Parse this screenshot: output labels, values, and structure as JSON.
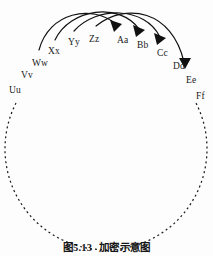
{
  "figure": {
    "caption_number": "图5.13",
    "caption_title": "加密示意图",
    "background_color": "#fdfdfd",
    "ink_color": "#1a1a1a"
  },
  "diagram": {
    "type": "cipher-wheel-mapping",
    "ring": {
      "name": "alphabet-ring",
      "style": "dashed",
      "shape": "circle",
      "center_x": 106,
      "center_y": 195,
      "radius": 101,
      "dash_pattern": "2 3"
    },
    "plaintext_labels": [
      {
        "id": "uu",
        "text": "Uu",
        "x": 9,
        "y": 86
      },
      {
        "id": "vv",
        "text": "Vv",
        "x": 21,
        "y": 71
      },
      {
        "id": "ww",
        "text": "Ww",
        "x": 32,
        "y": 59
      },
      {
        "id": "xx",
        "text": "Xx",
        "x": 48,
        "y": 47
      },
      {
        "id": "yy",
        "text": "Yy",
        "x": 68,
        "y": 38
      },
      {
        "id": "zz",
        "text": "Zz",
        "x": 89,
        "y": 35
      }
    ],
    "ciphertext_labels": [
      {
        "id": "aa",
        "text": "Aa",
        "x": 117,
        "y": 36
      },
      {
        "id": "bb",
        "text": "Bb",
        "x": 137,
        "y": 41
      },
      {
        "id": "cc",
        "text": "Cc",
        "x": 157,
        "y": 49
      },
      {
        "id": "dd",
        "text": "Dd",
        "x": 173,
        "y": 62
      },
      {
        "id": "ee",
        "text": "Ee",
        "x": 186,
        "y": 76
      },
      {
        "id": "ff",
        "text": "Ff",
        "x": 196,
        "y": 92
      }
    ],
    "mapping_arrows": [
      {
        "id": "arrow-ww-to-aa",
        "from": "Ww",
        "to": "Aa"
      },
      {
        "id": "arrow-xx-to-bb",
        "from": "Xx",
        "to": "Bb"
      },
      {
        "id": "arrow-yy-to-cc",
        "from": "Yy",
        "to": "Cc"
      },
      {
        "id": "arrow-zz-to-ee",
        "from": "Zz",
        "to": "Ee"
      }
    ]
  }
}
